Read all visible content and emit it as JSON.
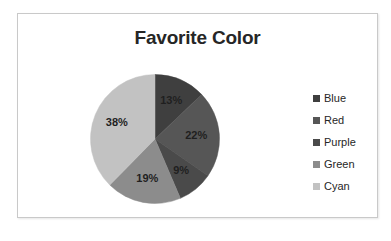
{
  "card": {
    "border_color": "#c9c9c9",
    "background": "#ffffff"
  },
  "chart_data": {
    "type": "pie",
    "title": "Favorite Color",
    "xlabel": "",
    "ylabel": "",
    "legend_position": "right",
    "grid": false,
    "start_angle_deg": 0,
    "direction": "clockwise",
    "categories": [
      "Blue",
      "Red",
      "Purple",
      "Green",
      "Cyan"
    ],
    "values": [
      13,
      22,
      9,
      19,
      38
    ],
    "value_unit": "%",
    "data_labels": [
      "13%",
      "22%",
      "9%",
      "19%",
      "38%"
    ],
    "colors": [
      "#3f3f3f",
      "#565656",
      "#4a4a4a",
      "#8c8c8c",
      "#c2c2c2"
    ],
    "slices": [
      {
        "label": "Blue",
        "value": 13,
        "data_label": "13%",
        "color": "#3f3f3f"
      },
      {
        "label": "Red",
        "value": 22,
        "data_label": "22%",
        "color": "#565656"
      },
      {
        "label": "Purple",
        "value": 9,
        "data_label": "9%",
        "color": "#4a4a4a"
      },
      {
        "label": "Green",
        "value": 19,
        "data_label": "19%",
        "color": "#8c8c8c"
      },
      {
        "label": "Cyan",
        "value": 38,
        "data_label": "38%",
        "color": "#c2c2c2"
      }
    ]
  },
  "legend": {
    "items": [
      {
        "label": "Blue",
        "color": "#3f3f3f"
      },
      {
        "label": "Red",
        "color": "#565656"
      },
      {
        "label": "Purple",
        "color": "#4a4a4a"
      },
      {
        "label": "Green",
        "color": "#8c8c8c"
      },
      {
        "label": "Cyan",
        "color": "#c2c2c2"
      }
    ]
  }
}
